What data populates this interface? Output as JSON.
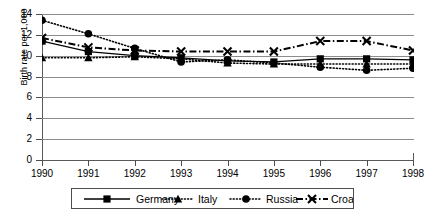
{
  "chart_data": {
    "type": "line",
    "title": "",
    "xlabel": "",
    "ylabel": "Birth rate per 1,000",
    "categories": [
      "1990",
      "1991",
      "1992",
      "1993",
      "1994",
      "1995",
      "1996",
      "1997",
      "1998"
    ],
    "x": [
      1990,
      1991,
      1992,
      1993,
      1994,
      1995,
      1996,
      1997,
      1998
    ],
    "ylim": [
      0,
      14
    ],
    "yticks": [
      0,
      2,
      4,
      6,
      8,
      10,
      12,
      14
    ],
    "ytick_labels": [
      "0",
      "2",
      "4",
      "6",
      "8",
      "10",
      "12",
      "14"
    ],
    "xlim": [
      1990,
      1998
    ],
    "grid": true,
    "grid_axis": "y",
    "legend_position": "bottom",
    "series": [
      {
        "name": "Germany",
        "marker": "square",
        "line_style": "solid",
        "color": "#000000",
        "values": [
          11.4,
          10.4,
          10.0,
          9.8,
          9.5,
          9.4,
          9.7,
          9.7,
          9.6
        ]
      },
      {
        "name": "Italy",
        "marker": "triangle",
        "line_style": "dotted",
        "color": "#000000",
        "values": [
          9.8,
          9.8,
          9.9,
          9.7,
          9.3,
          9.2,
          9.2,
          9.2,
          9.2
        ]
      },
      {
        "name": "Russia",
        "marker": "circle",
        "line_style": "dotted",
        "color": "#000000",
        "values": [
          13.4,
          12.1,
          10.7,
          9.4,
          9.6,
          9.3,
          8.9,
          8.6,
          8.8
        ]
      },
      {
        "name": "Croatia",
        "marker": "x",
        "line_style": "dash-dot",
        "color": "#000000",
        "values": [
          11.7,
          10.8,
          10.5,
          10.4,
          10.4,
          10.4,
          11.4,
          11.4,
          10.5
        ]
      }
    ]
  },
  "legend": {
    "items": [
      {
        "label": "Germany",
        "marker": "square",
        "line_style": "solid"
      },
      {
        "label": "Italy",
        "marker": "triangle",
        "line_style": "dotted"
      },
      {
        "label": "Russia",
        "marker": "circle",
        "line_style": "dotted"
      },
      {
        "label": "Croatia",
        "marker": "x",
        "line_style": "dash-dot"
      }
    ]
  },
  "axis": {
    "y_title": "Birth rate per 1,000"
  }
}
